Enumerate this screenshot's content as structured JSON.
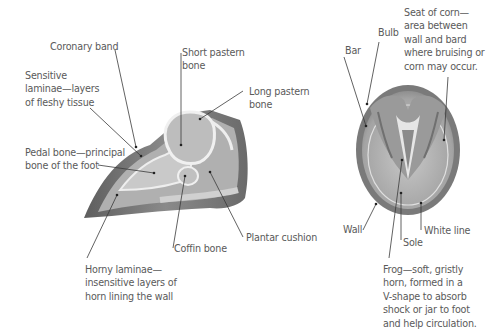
{
  "diagram": {
    "side_view": {
      "name": "Hoof cross-section",
      "labels": {
        "coronary_band": "Coronary band",
        "short_pastern": "Short pastern\nbone",
        "long_pastern": "Long pastern\nbone",
        "sensitive_laminae": "Sensitive\nlaminae—layers\nof fleshy tissue",
        "pedal_bone": "Pedal bone—principal\nbone of the foot",
        "plantar_cushion": "Plantar cushion",
        "coffin_bone": "Coffin bone",
        "horny_laminae": "Horny laminae—\ninsensitive layers of\nhorn lining the wall"
      }
    },
    "underside_view": {
      "name": "Hoof underside",
      "labels": {
        "bulb": "Bulb",
        "bar": "Bar",
        "seat_of_corn": "Seat of corn—\narea between\nwall and bard\nwhere bruising or\ncorn may occur.",
        "wall": "Wall",
        "white_line": "White line",
        "sole": "Sole",
        "frog": "Frog—soft, gristly\nhorn, formed in a\nV-shape to absorb\nshock or jar to foot\nand help circulation."
      }
    },
    "colors": {
      "text": "#5a5a5a",
      "leader_line": "#3a3a3a",
      "horn_dark": "#6e6e6e",
      "horn_mid": "#a8a8a8",
      "bone": "#b8b8b8",
      "light": "#e8e8e8"
    }
  }
}
